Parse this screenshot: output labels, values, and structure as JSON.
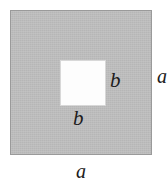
{
  "figure": {
    "kind": "geometry-diagram",
    "canvas": {
      "width_px": 168,
      "height_px": 189,
      "background_color": "#ffffff"
    },
    "outer_square": {
      "name": "outer-square",
      "side_label": "a",
      "fill_color": "#bfbfbf",
      "border_color": "#9a9a9a",
      "x_px": 10,
      "y_px": 10,
      "width_px": 142,
      "height_px": 145
    },
    "inner_square": {
      "name": "inner-square",
      "side_label": "b",
      "fill_color": "#fdfdfd",
      "border_color": "#d8d8d8",
      "x_px": 60,
      "y_px": 60,
      "width_px": 46,
      "height_px": 46
    },
    "labels": [
      {
        "id": "b-right",
        "text": "b",
        "describes": "inner-square",
        "position": "right-of-inner-square",
        "color": "#1c1c1c",
        "style": "italic"
      },
      {
        "id": "b-bottom",
        "text": "b",
        "describes": "inner-square",
        "position": "below-inner-square",
        "color": "#1c1c1c",
        "style": "italic"
      },
      {
        "id": "a-right",
        "text": "a",
        "describes": "outer-square",
        "position": "right-of-outer-square",
        "color": "#1c1c1c",
        "style": "italic"
      },
      {
        "id": "a-bottom",
        "text": "a",
        "describes": "outer-square",
        "position": "below-outer-square",
        "color": "#1c1c1c",
        "style": "italic"
      }
    ]
  }
}
